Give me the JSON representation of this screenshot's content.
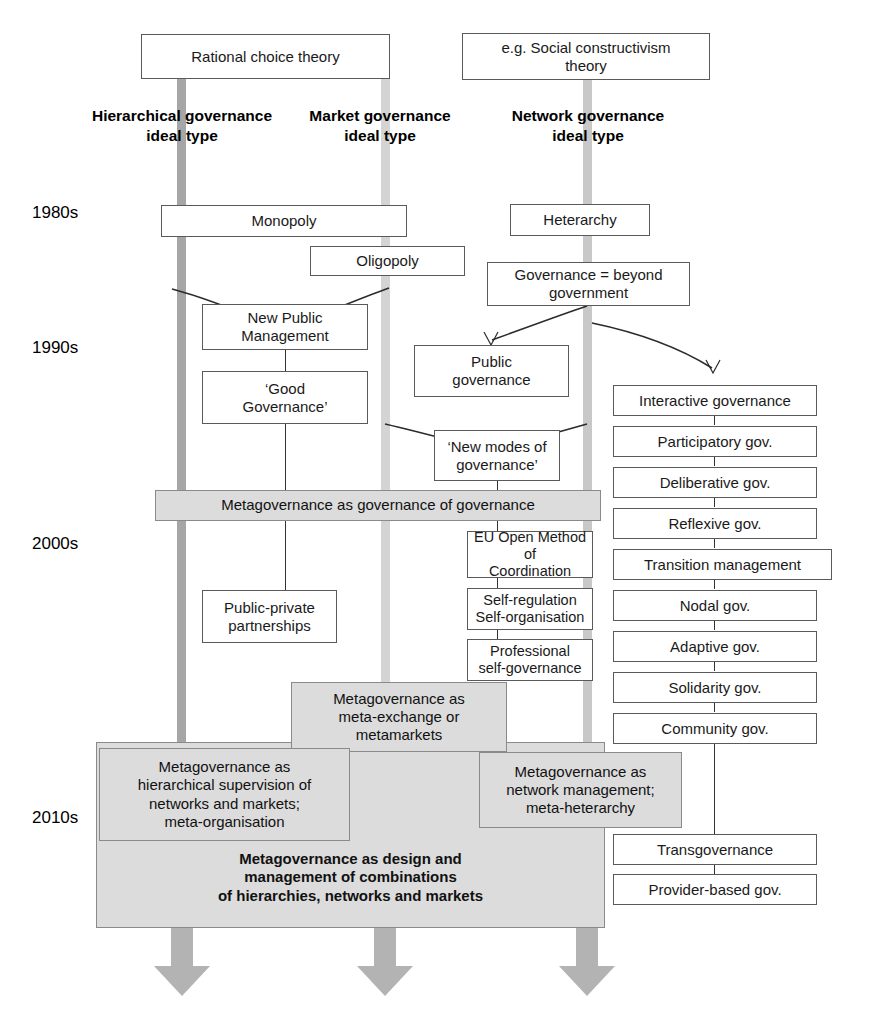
{
  "diagram": {
    "theory_boxes": [
      {
        "id": "rational-choice",
        "label": "Rational choice theory"
      },
      {
        "id": "social-constructivism",
        "label": "e.g. Social constructivism\ntheory"
      }
    ],
    "column_labels": [
      {
        "id": "hierarchical",
        "label": "Hierarchical governance\nideal type"
      },
      {
        "id": "market",
        "label": "Market governance\nideal type"
      },
      {
        "id": "network",
        "label": "Network governance\nideal type"
      }
    ],
    "decades": [
      {
        "id": "1980s",
        "label": "1980s"
      },
      {
        "id": "1990s",
        "label": "1990s"
      },
      {
        "id": "2000s",
        "label": "2000s"
      },
      {
        "id": "2010s",
        "label": "2010s"
      }
    ],
    "hierarchy_boxes": [
      {
        "id": "monopoly",
        "label": "Monopoly"
      },
      {
        "id": "new-public-management",
        "label": "New Public\nManagement"
      },
      {
        "id": "good-governance",
        "label": "‘Good\nGovernance’"
      },
      {
        "id": "public-private-partnerships",
        "label": "Public-private\npartnerships"
      }
    ],
    "market_boxes": [
      {
        "id": "oligopoly",
        "label": "Oligopoly"
      },
      {
        "id": "public-governance",
        "label": "Public\ngovernance"
      },
      {
        "id": "new-modes-of-governance",
        "label": "‘New modes of\ngovernance’"
      },
      {
        "id": "eu-open-method",
        "label": "EU Open Method of\nCoordination"
      },
      {
        "id": "self-regulation",
        "label": "Self-regulation\nSelf-organisation"
      },
      {
        "id": "professional-self-governance",
        "label": "Professional\nself-governance"
      }
    ],
    "network_boxes": [
      {
        "id": "heterarchy",
        "label": "Heterarchy"
      },
      {
        "id": "governance-beyond-government",
        "label": "Governance = beyond\ngovernment"
      },
      {
        "id": "interactive-governance",
        "label": "Interactive governance"
      },
      {
        "id": "participatory-gov",
        "label": "Participatory gov."
      },
      {
        "id": "deliberative-gov",
        "label": "Deliberative gov."
      },
      {
        "id": "reflexive-gov",
        "label": "Reflexive gov."
      },
      {
        "id": "transition-management",
        "label": "Transition management"
      },
      {
        "id": "nodal-gov",
        "label": "Nodal gov."
      },
      {
        "id": "adaptive-gov",
        "label": "Adaptive gov."
      },
      {
        "id": "solidarity-gov",
        "label": "Solidarity gov."
      },
      {
        "id": "community-gov",
        "label": "Community gov."
      },
      {
        "id": "transgovernance",
        "label": "Transgovernance"
      },
      {
        "id": "provider-based-gov",
        "label": "Provider-based gov."
      }
    ],
    "metagovernance_boxes": [
      {
        "id": "meta-governance-of-governance",
        "label": "Metagovernance as governance of governance"
      },
      {
        "id": "meta-exchange",
        "label": "Metagovernance as\nmeta-exchange or\nmetamarkets"
      },
      {
        "id": "meta-hierarchical-supervision",
        "label": "Metagovernance as\nhierarchical supervision of\nnetworks and markets;\nmeta-organisation"
      },
      {
        "id": "meta-network-management",
        "label": "Metagovernance as\nnetwork management;\nmeta-heterarchy"
      },
      {
        "id": "meta-design-and-management",
        "label": "Metagovernance as design and\nmanagement of combinations\nof hierarchies, networks and markets"
      }
    ],
    "colors": {
      "hierarchy_bar": "#a6a6a6",
      "market_bar": "#d4d4d4",
      "network_bar": "#c8c8c8",
      "metagovernance_fill": "#dcdcdc",
      "box_border": "#5a5a5a",
      "arrow_fill": "#b3b3b3",
      "text": "#1a1a1a"
    },
    "arrows": [
      {
        "id": "arrow-hierarchy-down"
      },
      {
        "id": "arrow-market-down"
      },
      {
        "id": "arrow-network-down"
      }
    ]
  }
}
